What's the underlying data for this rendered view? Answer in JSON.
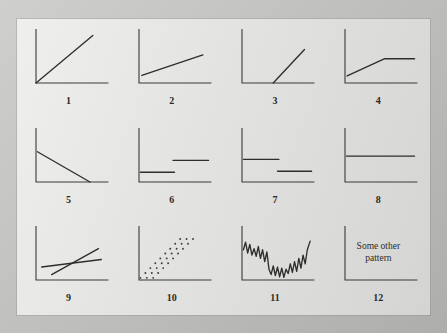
{
  "figure": {
    "colors": {
      "mat": "#b5b5b3",
      "page": "#dcdcda",
      "axis": "#3a3a38",
      "series": "#2e2e2c",
      "label": "#2a2a28"
    }
  },
  "panels": [
    {
      "label": "1",
      "name": "panel-linear-increase-from-origin",
      "description": "Straight line rising from the origin",
      "chart_ref": 0
    },
    {
      "label": "2",
      "name": "panel-gentle-linear-increase",
      "description": "Gentle straight rise from a positive intercept",
      "chart_ref": 1
    },
    {
      "label": "3",
      "name": "panel-delayed-steep-increase",
      "description": "Flat at zero then a steep rise after a threshold",
      "chart_ref": 2
    },
    {
      "label": "4",
      "name": "panel-rise-then-plateau",
      "description": "Rises then levels off at a plateau",
      "chart_ref": 3
    },
    {
      "label": "5",
      "name": "panel-linear-decrease-to-zero",
      "description": "Straight decline reaching zero before the right edge",
      "chart_ref": 4
    },
    {
      "label": "6",
      "name": "panel-step-up",
      "description": "Two flat levels with an upward step at midpoint",
      "chart_ref": 5
    },
    {
      "label": "7",
      "name": "panel-step-down",
      "description": "Two flat levels with a downward step at midpoint",
      "chart_ref": 6
    },
    {
      "label": "8",
      "name": "panel-constant-level",
      "description": "Single constant horizontal level",
      "chart_ref": 7
    },
    {
      "label": "9",
      "name": "panel-crossing-lines",
      "description": "Two lines of different slope crossing near the centre",
      "chart_ref": 8
    },
    {
      "label": "10",
      "name": "panel-scattered-diagonal-bands",
      "description": "Dotted points forming three parallel diagonal bands",
      "chart_ref": 9
    },
    {
      "label": "11",
      "name": "panel-volatile-zigzag",
      "description": "Noisy volatile series falling then recovering",
      "chart_ref": 10
    },
    {
      "label": "12",
      "name": "panel-some-other-pattern",
      "description": "Empty axes annotated with text",
      "chart_ref": 11,
      "text_line_1": "Some other",
      "text_line_2": "pattern"
    }
  ],
  "chart_data": [
    {
      "type": "line",
      "title": "1",
      "xlabel": "",
      "ylabel": "",
      "xlim": [
        0,
        100
      ],
      "ylim": [
        0,
        100
      ],
      "grid": false,
      "legend": "none",
      "series": [
        {
          "name": "linear-from-origin",
          "x": [
            0,
            80
          ],
          "y": [
            0,
            88
          ]
        }
      ]
    },
    {
      "type": "line",
      "title": "2",
      "xlabel": "",
      "ylabel": "",
      "xlim": [
        0,
        100
      ],
      "ylim": [
        0,
        100
      ],
      "grid": false,
      "legend": "none",
      "series": [
        {
          "name": "gentle-rise",
          "x": [
            4,
            90
          ],
          "y": [
            14,
            52
          ]
        }
      ]
    },
    {
      "type": "line",
      "title": "3",
      "xlabel": "",
      "ylabel": "",
      "xlim": [
        0,
        100
      ],
      "ylim": [
        0,
        100
      ],
      "grid": false,
      "legend": "none",
      "series": [
        {
          "name": "delayed-steep-rise",
          "x": [
            44,
            88
          ],
          "y": [
            0,
            62
          ]
        }
      ]
    },
    {
      "type": "line",
      "title": "4",
      "xlabel": "",
      "ylabel": "",
      "xlim": [
        0,
        100
      ],
      "ylim": [
        0,
        100
      ],
      "grid": false,
      "legend": "none",
      "series": [
        {
          "name": "rise-then-plateau",
          "x": [
            3,
            56,
            98
          ],
          "y": [
            13,
            45,
            45
          ]
        }
      ]
    },
    {
      "type": "line",
      "title": "5",
      "xlabel": "",
      "ylabel": "",
      "xlim": [
        0,
        100
      ],
      "ylim": [
        0,
        100
      ],
      "grid": false,
      "legend": "none",
      "series": [
        {
          "name": "linear-decline",
          "x": [
            2,
            76
          ],
          "y": [
            56,
            0
          ]
        }
      ]
    },
    {
      "type": "line",
      "title": "6",
      "xlabel": "",
      "ylabel": "",
      "xlim": [
        0,
        100
      ],
      "ylim": [
        0,
        100
      ],
      "grid": false,
      "legend": "none",
      "series": [
        {
          "name": "lower-level",
          "x": [
            2,
            50
          ],
          "y": [
            18,
            18
          ]
        },
        {
          "name": "upper-level",
          "x": [
            48,
            98
          ],
          "y": [
            40,
            40
          ]
        }
      ]
    },
    {
      "type": "line",
      "title": "7",
      "xlabel": "",
      "ylabel": "",
      "xlim": [
        0,
        100
      ],
      "ylim": [
        0,
        100
      ],
      "grid": false,
      "legend": "none",
      "series": [
        {
          "name": "upper-level",
          "x": [
            2,
            52
          ],
          "y": [
            42,
            42
          ]
        },
        {
          "name": "lower-level",
          "x": [
            50,
            98
          ],
          "y": [
            20,
            20
          ]
        }
      ]
    },
    {
      "type": "line",
      "title": "8",
      "xlabel": "",
      "ylabel": "",
      "xlim": [
        0,
        100
      ],
      "ylim": [
        0,
        100
      ],
      "grid": false,
      "legend": "none",
      "series": [
        {
          "name": "constant",
          "x": [
            2,
            98
          ],
          "y": [
            48,
            48
          ]
        }
      ]
    },
    {
      "type": "line",
      "title": "9",
      "xlabel": "",
      "ylabel": "",
      "xlim": [
        0,
        100
      ],
      "ylim": [
        0,
        100
      ],
      "grid": false,
      "legend": "none",
      "series": [
        {
          "name": "steep-line",
          "x": [
            22,
            88
          ],
          "y": [
            10,
            58
          ]
        },
        {
          "name": "shallow-line",
          "x": [
            8,
            92
          ],
          "y": [
            24,
            38
          ]
        }
      ]
    },
    {
      "type": "scatter",
      "title": "10",
      "xlabel": "",
      "ylabel": "",
      "xlim": [
        0,
        100
      ],
      "ylim": [
        0,
        100
      ],
      "grid": false,
      "legend": "none",
      "series": [
        {
          "name": "band-a",
          "x": [
            2,
            9,
            16,
            23,
            30,
            37,
            44,
            51,
            58
          ],
          "y": [
            4,
            13,
            22,
            31,
            40,
            49,
            58,
            67,
            76
          ]
        },
        {
          "name": "band-b",
          "x": [
            11,
            18,
            25,
            32,
            39,
            46,
            53,
            60,
            67
          ],
          "y": [
            4,
            13,
            22,
            31,
            40,
            49,
            58,
            67,
            76
          ]
        },
        {
          "name": "band-c",
          "x": [
            20,
            27,
            34,
            41,
            48,
            55,
            62,
            69,
            76
          ],
          "y": [
            4,
            13,
            22,
            31,
            40,
            49,
            58,
            67,
            76
          ]
        }
      ]
    },
    {
      "type": "line",
      "title": "11",
      "xlabel": "",
      "ylabel": "",
      "xlim": [
        0,
        100
      ],
      "ylim": [
        0,
        100
      ],
      "grid": false,
      "legend": "none",
      "series": [
        {
          "name": "volatile",
          "x": [
            2,
            5,
            8,
            11,
            14,
            17,
            20,
            23,
            26,
            29,
            32,
            35,
            38,
            41,
            44,
            47,
            50,
            53,
            56,
            59,
            62,
            65,
            68,
            71,
            74,
            77,
            80,
            83,
            86,
            89,
            92,
            96
          ],
          "y": [
            56,
            70,
            50,
            66,
            46,
            58,
            44,
            62,
            40,
            56,
            34,
            52,
            20,
            10,
            26,
            8,
            24,
            6,
            22,
            5,
            20,
            12,
            30,
            14,
            34,
            16,
            40,
            22,
            46,
            30,
            56,
            72
          ]
        }
      ]
    },
    {
      "type": "table",
      "title": "12",
      "xlabel": "",
      "ylabel": "",
      "xlim": [
        0,
        100
      ],
      "ylim": [
        0,
        100
      ],
      "grid": false,
      "legend": "none",
      "annotation": "Some other pattern",
      "series": []
    }
  ]
}
